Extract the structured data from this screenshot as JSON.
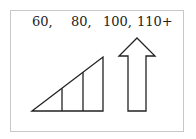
{
  "labels": [
    "60,",
    "80,",
    "100,",
    "110+"
  ],
  "figure": {
    "left_shape": "right-triangle-divided-into-three-sections",
    "right_shape": "upward-arrow-outline",
    "stroke_color": "#222222",
    "border_color": "#c8c8c8"
  }
}
